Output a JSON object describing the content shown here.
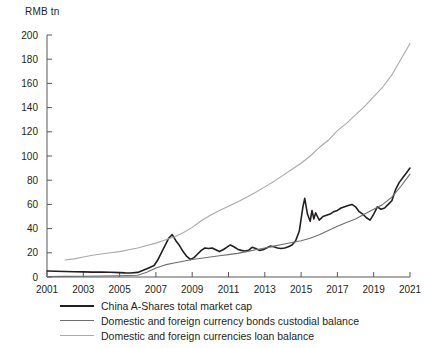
{
  "chart_data": {
    "type": "line",
    "title": "",
    "xlabel": "",
    "ylabel": "RMB tn",
    "unit_label": "RMB tn",
    "xlim": [
      2001,
      2021
    ],
    "ylim": [
      0,
      200
    ],
    "ytick_step": 20,
    "xtick_step": 2,
    "grid": false,
    "legend_position": "below-axis-left",
    "yticks": [
      "0",
      "20",
      "40",
      "60",
      "80",
      "100",
      "120",
      "140",
      "160",
      "180",
      "200"
    ],
    "xticks": [
      "2001",
      "2003",
      "2005",
      "2007",
      "2009",
      "2011",
      "2013",
      "2015",
      "2017",
      "2019",
      "2021"
    ],
    "colors": {
      "a_shares": "#231f20",
      "bonds": "#6d6e71",
      "loans": "#a7a9ac"
    },
    "series": [
      {
        "name": "China A-Shares total market cap",
        "color": "#231f20",
        "width": 1.6,
        "x": [
          2001.0,
          2001.5,
          2002.0,
          2002.5,
          2003.0,
          2003.5,
          2004.0,
          2004.5,
          2005.0,
          2005.3,
          2005.6,
          2006.0,
          2006.3,
          2006.6,
          2006.9,
          2007.1,
          2007.3,
          2007.5,
          2007.7,
          2007.9,
          2008.1,
          2008.3,
          2008.5,
          2008.7,
          2008.9,
          2009.1,
          2009.3,
          2009.5,
          2009.7,
          2009.9,
          2010.1,
          2010.3,
          2010.5,
          2010.7,
          2010.9,
          2011.1,
          2011.3,
          2011.5,
          2011.7,
          2011.9,
          2012.1,
          2012.3,
          2012.5,
          2012.7,
          2012.9,
          2013.1,
          2013.3,
          2013.5,
          2013.7,
          2013.9,
          2014.1,
          2014.3,
          2014.5,
          2014.7,
          2014.9,
          2015.0,
          2015.1,
          2015.2,
          2015.35,
          2015.5,
          2015.6,
          2015.7,
          2015.8,
          2015.9,
          2016.0,
          2016.2,
          2016.4,
          2016.6,
          2016.8,
          2017.0,
          2017.2,
          2017.4,
          2017.6,
          2017.8,
          2018.0,
          2018.2,
          2018.4,
          2018.6,
          2018.8,
          2019.0,
          2019.2,
          2019.4,
          2019.6,
          2019.8,
          2020.0,
          2020.2,
          2020.4,
          2020.6,
          2020.8,
          2021.0
        ],
        "y": [
          5.0,
          4.8,
          4.6,
          4.3,
          4.2,
          4.0,
          4.1,
          3.9,
          3.6,
          3.4,
          3.3,
          3.8,
          5.5,
          7.5,
          9.5,
          14.0,
          20.0,
          26.0,
          32.0,
          35.0,
          30.0,
          26.0,
          21.0,
          17.0,
          14.5,
          16.0,
          19.0,
          22.0,
          24.0,
          23.5,
          24.0,
          22.5,
          21.0,
          22.5,
          24.5,
          26.5,
          25.0,
          23.0,
          22.0,
          21.5,
          22.0,
          24.5,
          23.5,
          22.0,
          22.5,
          24.0,
          25.5,
          25.0,
          24.0,
          23.5,
          24.0,
          25.0,
          26.5,
          30.0,
          38.0,
          48.0,
          58.0,
          65.0,
          52.0,
          46.0,
          55.0,
          48.0,
          53.0,
          50.0,
          47.0,
          50.0,
          51.0,
          52.0,
          54.0,
          55.0,
          57.0,
          58.0,
          59.0,
          60.0,
          58.0,
          54.0,
          52.0,
          49.0,
          47.0,
          52.0,
          58.0,
          56.0,
          57.0,
          60.0,
          63.0,
          72.0,
          78.0,
          82.0,
          86.0,
          90.0
        ]
      },
      {
        "name": "Domestic and foreign currency bonds custodial balance",
        "color": "#6d6e71",
        "width": 1.1,
        "x": [
          2001.0,
          2002.0,
          2003.0,
          2004.0,
          2005.0,
          2006.0,
          2006.5,
          2007.0,
          2007.5,
          2008.0,
          2008.5,
          2009.0,
          2009.5,
          2010.0,
          2010.5,
          2011.0,
          2011.5,
          2012.0,
          2012.5,
          2013.0,
          2013.5,
          2014.0,
          2014.5,
          2015.0,
          2015.5,
          2016.0,
          2016.5,
          2017.0,
          2017.5,
          2018.0,
          2018.5,
          2019.0,
          2019.5,
          2020.0,
          2020.5,
          2021.0
        ],
        "y": [
          0.4,
          0.5,
          0.6,
          0.8,
          1.0,
          1.5,
          4.0,
          7.5,
          10.0,
          11.5,
          13.0,
          14.5,
          15.5,
          16.5,
          17.5,
          18.5,
          19.5,
          21.0,
          22.5,
          24.0,
          25.5,
          27.0,
          28.5,
          30.0,
          32.0,
          35.0,
          38.5,
          42.0,
          45.0,
          48.0,
          52.0,
          56.0,
          60.0,
          66.0,
          75.0,
          85.0
        ]
      },
      {
        "name": "Domestic and foreign currencies loan balance",
        "color": "#a7a9ac",
        "width": 1.1,
        "x": [
          2002.0,
          2002.5,
          2003.0,
          2003.5,
          2004.0,
          2004.5,
          2005.0,
          2005.5,
          2006.0,
          2006.5,
          2007.0,
          2007.5,
          2008.0,
          2008.5,
          2009.0,
          2009.5,
          2010.0,
          2010.5,
          2011.0,
          2011.5,
          2012.0,
          2012.5,
          2013.0,
          2013.5,
          2014.0,
          2014.5,
          2015.0,
          2015.5,
          2016.0,
          2016.5,
          2017.0,
          2017.5,
          2018.0,
          2018.5,
          2019.0,
          2019.5,
          2020.0,
          2020.5,
          2021.0
        ],
        "y": [
          14.0,
          15.0,
          16.5,
          18.0,
          19.0,
          20.0,
          21.0,
          22.5,
          24.0,
          26.0,
          28.0,
          30.5,
          33.0,
          36.5,
          41.0,
          46.5,
          51.0,
          55.0,
          58.5,
          62.0,
          66.0,
          70.0,
          74.5,
          79.0,
          84.0,
          89.0,
          94.0,
          100.0,
          107.0,
          113.0,
          121.0,
          127.0,
          134.0,
          141.0,
          149.0,
          157.0,
          167.0,
          180.0,
          193.0
        ]
      }
    ],
    "legend": [
      {
        "label": "China A-Shares total market cap",
        "color": "#231f20",
        "width": 2.2
      },
      {
        "label": "Domestic and foreign currency bonds custodial balance",
        "color": "#6d6e71",
        "width": 1.4
      },
      {
        "label": "Domestic and foreign currencies loan balance",
        "color": "#a7a9ac",
        "width": 1.4
      }
    ]
  }
}
